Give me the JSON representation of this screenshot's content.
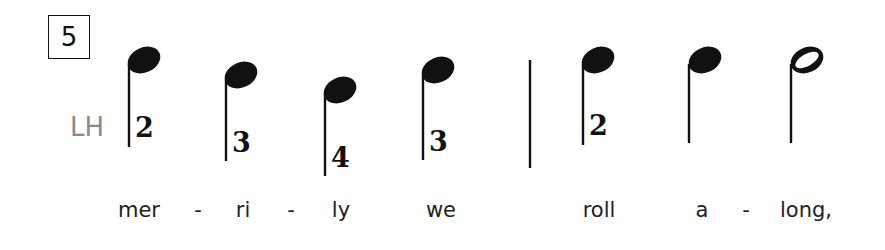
{
  "measure": {
    "number": "5"
  },
  "hand": {
    "label": "LH"
  },
  "notes": [
    {
      "type": "quarter",
      "head_x": 144,
      "head_y": 60,
      "stem_x": 129,
      "stem_bottom": 147,
      "finger": "2",
      "finger_x": 135,
      "finger_y": 112
    },
    {
      "type": "quarter",
      "head_x": 241,
      "head_y": 75,
      "stem_x": 226,
      "stem_bottom": 161,
      "finger": "3",
      "finger_x": 232,
      "finger_y": 127
    },
    {
      "type": "quarter",
      "head_x": 340,
      "head_y": 90,
      "stem_x": 325,
      "stem_bottom": 176,
      "finger": "4",
      "finger_x": 331,
      "finger_y": 142
    },
    {
      "type": "quarter",
      "head_x": 438,
      "head_y": 70,
      "stem_x": 423,
      "stem_bottom": 160,
      "finger": "3",
      "finger_x": 429,
      "finger_y": 126
    },
    {
      "type": "quarter",
      "head_x": 598,
      "head_y": 60,
      "stem_x": 583,
      "stem_bottom": 145,
      "finger": "2",
      "finger_x": 589,
      "finger_y": 110
    },
    {
      "type": "quarter",
      "head_x": 705,
      "head_y": 60,
      "stem_x": 689,
      "stem_bottom": 143,
      "finger": "",
      "finger_x": 0,
      "finger_y": 0
    },
    {
      "type": "half",
      "head_x": 807,
      "head_y": 60,
      "stem_x": 791,
      "stem_bottom": 143,
      "finger": "",
      "finger_x": 0,
      "finger_y": 0
    }
  ],
  "barline": {
    "x": 530,
    "top": 60,
    "bottom": 168
  },
  "lyrics": [
    {
      "text": "mer",
      "x": 139
    },
    {
      "text": "-",
      "x": 198
    },
    {
      "text": "ri",
      "x": 243
    },
    {
      "text": "-",
      "x": 291
    },
    {
      "text": "ly",
      "x": 341
    },
    {
      "text": "we",
      "x": 441
    },
    {
      "text": "roll",
      "x": 599
    },
    {
      "text": "a",
      "x": 702
    },
    {
      "text": "-",
      "x": 746
    },
    {
      "text": "long,",
      "x": 806
    }
  ]
}
